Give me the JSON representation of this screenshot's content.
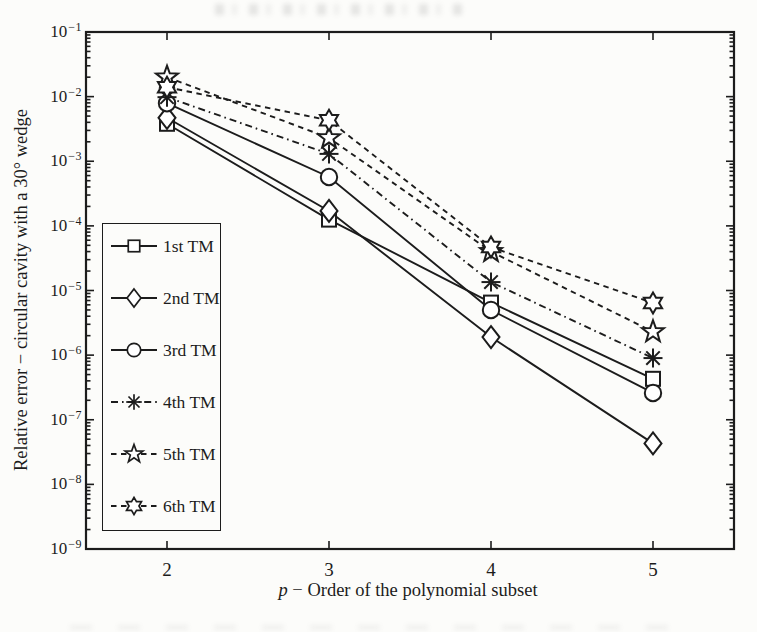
{
  "figure": {
    "background": "#fcfcfa",
    "ink": "#1c1c1c",
    "marker_fill": "#ffffff"
  },
  "chart_data": {
    "type": "line",
    "title": "",
    "x": [
      2,
      3,
      4,
      5
    ],
    "xlabel_italic": "p",
    "xlabel_rest": " − Order of the polynomial subset",
    "ylabel": "Relative error − circular cavity with a 30° wedge",
    "xlim": [
      1.5,
      5.5
    ],
    "ylim": [
      1e-09,
      0.1
    ],
    "yscale": "log",
    "grid": false,
    "xticks": [
      2,
      3,
      4,
      5
    ],
    "ytick_exponents": [
      -1,
      -2,
      -3,
      -4,
      -5,
      -6,
      -7,
      -8,
      -9
    ],
    "legend_position": "lower-left-inside",
    "series": [
      {
        "name": "1st TM",
        "marker": "square",
        "line": "solid",
        "values": [
          0.0038,
          0.000125,
          6.5e-06,
          4.3e-07
        ]
      },
      {
        "name": "2nd TM",
        "marker": "diamond",
        "line": "solid",
        "values": [
          0.0047,
          0.00017,
          1.9e-06,
          4.3e-08
        ]
      },
      {
        "name": "3rd TM",
        "marker": "circle",
        "line": "solid",
        "values": [
          0.0079,
          0.00057,
          5e-06,
          2.6e-07
        ]
      },
      {
        "name": "4th TM",
        "marker": "asterisk",
        "line": "dashdot",
        "values": [
          0.0098,
          0.0013,
          1.35e-05,
          9e-07
        ]
      },
      {
        "name": "5th TM",
        "marker": "star5",
        "line": "dashed",
        "values": [
          0.02,
          0.0023,
          4e-05,
          2.3e-06
        ]
      },
      {
        "name": "6th TM",
        "marker": "star6",
        "line": "dashed",
        "values": [
          0.014,
          0.0043,
          4.7e-05,
          6.4e-06
        ]
      }
    ]
  }
}
